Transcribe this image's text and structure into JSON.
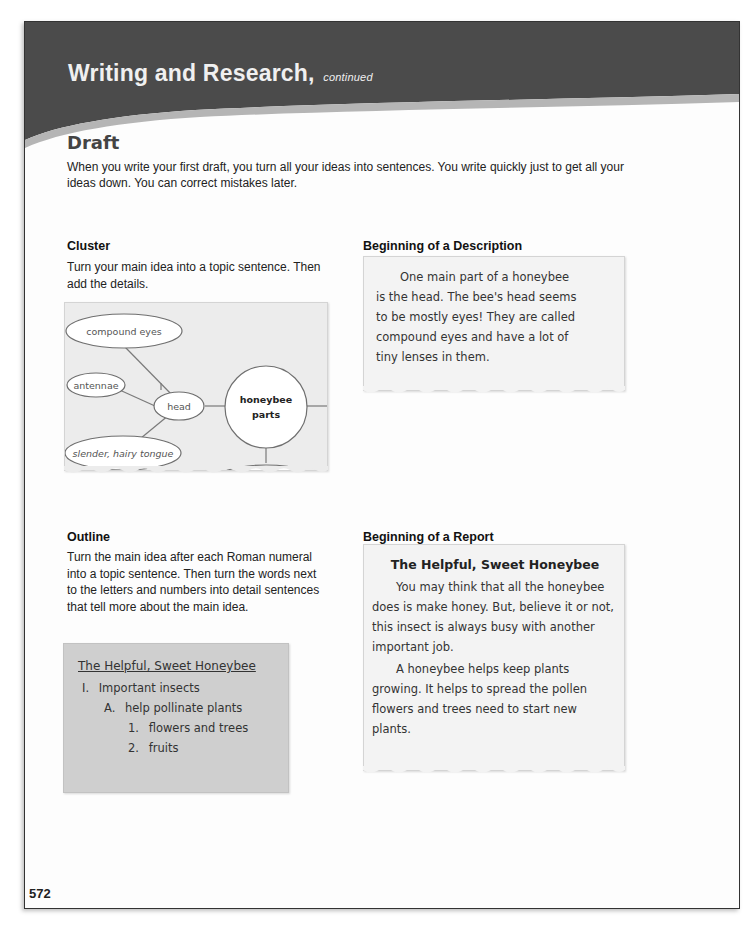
{
  "header": {
    "title": "Writing and Research,",
    "subtitle": "continued"
  },
  "section": {
    "title": "Draft",
    "intro": "When you write your first draft, you turn all your ideas into sentences. You write quickly just to get all your ideas down. You can correct mistakes later."
  },
  "cluster": {
    "heading": "Cluster",
    "instruction": "Turn your main idea into a topic sentence. Then add the details.",
    "nodes": {
      "compound_eyes": "compound eyes",
      "antennae": "antennae",
      "head": "head",
      "tongue": "slender, hairy tongue",
      "center_line1": "honeybee",
      "center_line2": "parts"
    }
  },
  "description": {
    "heading": "Beginning of a Description",
    "lines": [
      "One main part of a honeybee",
      "is the head. The bee's head seems",
      "to be mostly eyes! They are called",
      "compound eyes and have a lot of",
      "tiny lenses in them."
    ]
  },
  "outline": {
    "heading": "Outline",
    "instruction": "Turn the main idea after each Roman numeral into a topic sentence. Then turn the words next to the letters and numbers into detail sentences that tell more about the main idea.",
    "title": "The Helpful, Sweet Honeybee",
    "items": [
      {
        "marker": "I.",
        "text": "Important insects",
        "level": 0
      },
      {
        "marker": "A.",
        "text": "help pollinate plants",
        "level": 1
      },
      {
        "marker": "1.",
        "text": "flowers and trees",
        "level": 2
      },
      {
        "marker": "2.",
        "text": "fruits",
        "level": 2
      }
    ]
  },
  "report": {
    "heading": "Beginning of a Report",
    "title": "The Helpful, Sweet Honeybee",
    "paragraphs": [
      "You may think that all the honeybee does is make honey. But, believe it or not, this insect is always busy with another important job.",
      "A honeybee helps keep plants growing. It helps to spread the pollen flowers and trees need to start new plants."
    ]
  },
  "footer": {
    "page_number": "572"
  },
  "colors": {
    "header_band": "#4a4a4a",
    "header_swoosh": "#b8b8b8",
    "box_light": "#ececec",
    "box_dark": "#cfcfcf"
  }
}
